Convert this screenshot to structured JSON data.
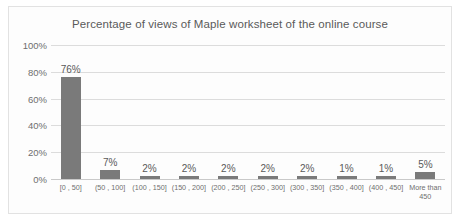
{
  "card": {
    "border_color": "#e2e2e2",
    "background": "#fdfdfd"
  },
  "chart_data": {
    "type": "bar",
    "title": "Percentage of views of Maple worksheet of the online course",
    "xlabel": "",
    "ylabel": "",
    "ylim": [
      0,
      100
    ],
    "grid": true,
    "legend": "none",
    "bar_color": "#7a7a7a",
    "categories": [
      "[0 , 50]",
      "(50 , 100]",
      "(100 , 150]",
      "(150 , 200]",
      "(200 , 250]",
      "(250 , 300]",
      "(300 , 350]",
      "(350 , 400]",
      "(400 , 450]",
      "More than 450"
    ],
    "values": [
      76,
      7,
      2,
      2,
      2,
      2,
      2,
      1,
      1,
      5
    ],
    "value_labels": [
      "76%",
      "7%",
      "2%",
      "2%",
      "2%",
      "2%",
      "2%",
      "1%",
      "1%",
      "5%"
    ],
    "ytick_labels": [
      "100%",
      "80%",
      "60%",
      "40%",
      "20%",
      "0%"
    ],
    "ytick_values": [
      100,
      80,
      60,
      40,
      20,
      0
    ]
  }
}
